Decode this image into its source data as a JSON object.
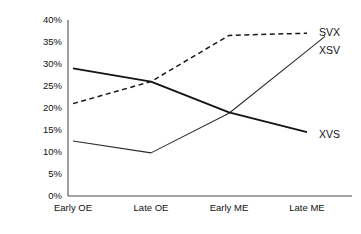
{
  "chart_data": {
    "type": "line",
    "title": "",
    "xlabel": "",
    "ylabel": "",
    "categories": [
      "Early OE",
      "Late OE",
      "Early ME",
      "Late ME"
    ],
    "ylim": [
      0,
      40
    ],
    "ytick_labels": [
      "40%",
      "35%",
      "30%",
      "25%",
      "20%",
      "15%",
      "10%",
      "5%",
      "0%"
    ],
    "ytick_values": [
      40,
      35,
      30,
      25,
      20,
      15,
      10,
      5,
      0
    ],
    "grid": false,
    "legend_position": "line-end-labels",
    "series": [
      {
        "name": "SVX",
        "style": "dashed",
        "values": [
          21,
          26,
          36.5,
          37
        ]
      },
      {
        "name": "XSV",
        "style": "thin-solid",
        "values": [
          12.5,
          9.8,
          18.8,
          33
        ]
      },
      {
        "name": "XVS",
        "style": "thick-solid",
        "values": [
          29,
          26,
          19,
          14.5
        ]
      }
    ]
  },
  "axis": {
    "y_labels": [
      "40%",
      "35%",
      "30%",
      "25%",
      "20%",
      "15%",
      "10%",
      "5%",
      "0%"
    ],
    "x_labels": [
      "Early OE",
      "Late OE",
      "Early ME",
      "Late ME"
    ]
  },
  "series_labels": {
    "svx": "SVX",
    "xsv": "XSV",
    "xvs": "XVS"
  },
  "colors": {
    "line": "#1a1a1a",
    "axis": "#4d4d4d",
    "background": "#ffffff"
  }
}
